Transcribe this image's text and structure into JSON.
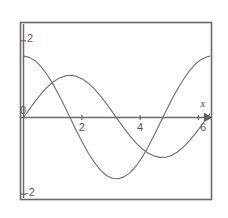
{
  "chart_data": {
    "type": "line",
    "title": "",
    "subtitle": "",
    "xlabel": "x",
    "ylabel": "",
    "xlim": [
      0,
      6.3
    ],
    "ylim": [
      -2.35,
      2.35
    ],
    "grid": false,
    "legend": "none",
    "x_ticks": [
      {
        "value": 0,
        "label": "0"
      },
      {
        "value": 2,
        "label": "2"
      },
      {
        "value": 4,
        "label": "4"
      },
      {
        "value": 6,
        "label": "6"
      }
    ],
    "y_ticks": [
      {
        "value": 2,
        "label": "2"
      },
      {
        "value": -2,
        "label": "-2"
      }
    ],
    "axis_arrow": "right",
    "frame": "box",
    "series": [
      {
        "name": "curve-cosine",
        "color": "#6e6e6e",
        "x": [
          0,
          0.2,
          0.4,
          0.6,
          0.8,
          1.0,
          1.2,
          1.4,
          1.6,
          1.8,
          2.0,
          2.2,
          2.4,
          2.6,
          2.8,
          3.0,
          3.2,
          3.4,
          3.6,
          3.8,
          4.0,
          4.2,
          4.4,
          4.6,
          4.8,
          5.0,
          5.2,
          5.4,
          5.6,
          5.8,
          6.0,
          6.2,
          6.3
        ],
        "y": [
          1.6,
          1.568,
          1.474,
          1.321,
          1.115,
          0.864,
          0.58,
          0.272,
          -0.047,
          -0.364,
          -0.666,
          -0.94,
          -1.179,
          -1.372,
          -1.512,
          -1.584,
          -1.597,
          -1.548,
          -1.438,
          -1.27,
          -1.046,
          -0.783,
          -0.484,
          -0.167,
          0.152,
          0.454,
          0.735,
          0.99,
          1.212,
          1.389,
          1.514,
          1.585,
          1.6
        ]
      },
      {
        "name": "curve-sine",
        "color": "#6e6e6e",
        "x": [
          0,
          0.2,
          0.4,
          0.6,
          0.8,
          1.0,
          1.2,
          1.4,
          1.6,
          1.8,
          2.0,
          2.2,
          2.4,
          2.6,
          2.8,
          3.0,
          3.2,
          3.4,
          3.6,
          3.8,
          4.0,
          4.2,
          4.4,
          4.6,
          4.8,
          5.0,
          5.2,
          5.4,
          5.6,
          5.8,
          6.0,
          6.2,
          6.3
        ],
        "y": [
          0.0,
          0.218,
          0.427,
          0.621,
          0.789,
          0.927,
          1.026,
          1.085,
          1.1,
          1.072,
          1.0,
          0.888,
          0.74,
          0.562,
          0.362,
          0.148,
          -0.07,
          -0.283,
          -0.484,
          -0.661,
          -0.81,
          -0.926,
          -1.0,
          -1.04,
          -1.036,
          -0.989,
          -0.9,
          -0.772,
          -0.612,
          -0.425,
          -0.222,
          -0.011,
          0.096
        ]
      }
    ],
    "intersections": [
      {
        "x": 0.9,
        "y": 0.95
      },
      {
        "x": 4.2,
        "y": -0.84
      }
    ]
  }
}
